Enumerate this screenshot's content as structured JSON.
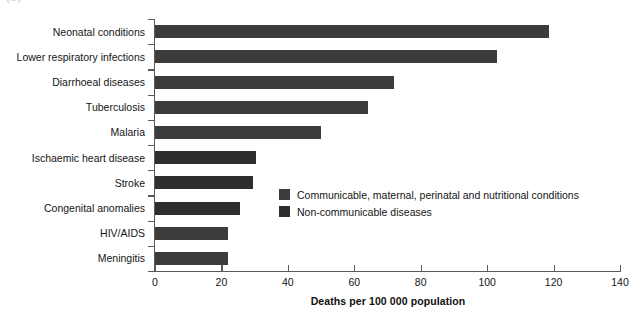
{
  "panel": {
    "label": "(b)"
  },
  "chart_data": {
    "type": "bar",
    "orientation": "horizontal",
    "title": "",
    "xlabel": "Deaths per 100 000 population",
    "ylabel": "",
    "xlim": [
      0,
      140
    ],
    "xticks": [
      0,
      20,
      40,
      60,
      80,
      100,
      120,
      140
    ],
    "grid": false,
    "legend_position": "inside-center-right",
    "categories": [
      "Neonatal conditions",
      "Lower respiratory infections",
      "Diarrhoeal diseases",
      "Tuberculosis",
      "Malaria",
      "Ischaemic heart disease",
      "Stroke",
      "Congenital anomalies",
      "HIV/AIDS",
      "Meningitis"
    ],
    "values": [
      118.6,
      103.0,
      72.0,
      64.0,
      50.0,
      30.4,
      29.5,
      25.6,
      22.0,
      22.0
    ],
    "group_of": [
      "communicable",
      "communicable",
      "communicable",
      "communicable",
      "communicable",
      "non-communicable",
      "non-communicable",
      "non-communicable",
      "communicable",
      "communicable"
    ],
    "series": [
      {
        "name": "Communicable, maternal, perinatal and nutritional conditions",
        "key": "communicable",
        "color": "#3c3c3c"
      },
      {
        "name": "Non-communicable diseases",
        "key": "non-communicable",
        "color": "#2e2e2e"
      }
    ],
    "legend": [
      "Communicable, maternal, perinatal and nutritional conditions",
      "Non-communicable diseases"
    ]
  }
}
